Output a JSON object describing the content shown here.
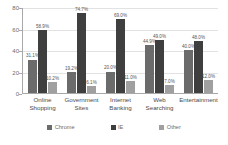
{
  "chart_data": {
    "type": "bar",
    "title": "",
    "subtitle": "",
    "xlabel": "",
    "ylabel": "",
    "ylim": [
      0,
      80
    ],
    "yticks": [
      0,
      20,
      40,
      60,
      80
    ],
    "grid": true,
    "legend_position": "bottom",
    "categories": [
      "Online\nShopping",
      "Government\nSites",
      "Internet\nBanking",
      "Web\nSearching",
      "Entertainment"
    ],
    "series": [
      {
        "name": "Chrome",
        "color": "#6b6b6b",
        "values": [
          31.1,
          19.2,
          20.0,
          44.9,
          40.0
        ],
        "labels": [
          "31.1%",
          "19.2%",
          "20.0%",
          "44.9%",
          "40.0%"
        ]
      },
      {
        "name": "IE",
        "color": "#3f3f3f",
        "values": [
          58.9,
          74.7,
          69.0,
          49.0,
          48.0
        ],
        "labels": [
          "58.9%",
          "74.7%",
          "69.0%",
          "49.0%",
          "48.0%"
        ]
      },
      {
        "name": "Other",
        "color": "#a0a0a0",
        "values": [
          10.2,
          6.1,
          11.0,
          7.0,
          12.0
        ],
        "labels": [
          "10.2%",
          "6.1%",
          "11.0%",
          "7.0%",
          "12.0%"
        ]
      }
    ]
  }
}
